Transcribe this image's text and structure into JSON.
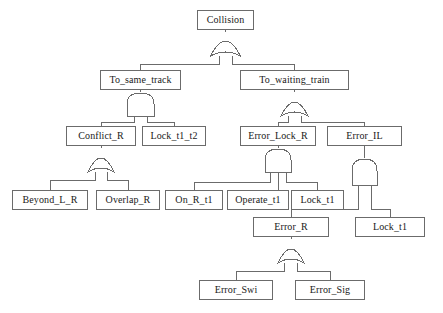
{
  "diagram": {
    "type": "fault-tree",
    "stroke_color": "#6b6b6b",
    "text_color": "#1a1a1a",
    "background": "#ffffff"
  },
  "nodes": [
    {
      "id": "collision",
      "label": "Collision",
      "x": 197,
      "y": 10,
      "w": 57,
      "h": 20,
      "level": 0,
      "kind": "top-event"
    },
    {
      "id": "to_same_track",
      "label": "To_same_track",
      "x": 100,
      "y": 70,
      "w": 81,
      "h": 20,
      "level": 1,
      "kind": "intermediate-event"
    },
    {
      "id": "to_waiting_train",
      "label": "To_waiting_train",
      "x": 240,
      "y": 70,
      "w": 109,
      "h": 20,
      "level": 1,
      "kind": "intermediate-event"
    },
    {
      "id": "conflict_r",
      "label": "Conflict_R",
      "x": 66,
      "y": 126,
      "w": 70,
      "h": 20,
      "level": 2,
      "kind": "intermediate-event"
    },
    {
      "id": "lock_t1_t2",
      "label": "Lock_t1_t2",
      "x": 142,
      "y": 126,
      "w": 64,
      "h": 20,
      "level": 2,
      "kind": "basic-event"
    },
    {
      "id": "error_lock_r",
      "label": "Error_Lock_R",
      "x": 240,
      "y": 126,
      "w": 76,
      "h": 20,
      "level": 2,
      "kind": "intermediate-event"
    },
    {
      "id": "error_il",
      "label": "Error_IL",
      "x": 327,
      "y": 126,
      "w": 75,
      "h": 20,
      "level": 2,
      "kind": "intermediate-event"
    },
    {
      "id": "beyond_l_r",
      "label": "Beyond_L_R",
      "x": 12,
      "y": 190,
      "w": 76,
      "h": 20,
      "level": 3,
      "kind": "basic-event"
    },
    {
      "id": "overlap_r",
      "label": "Overlap_R",
      "x": 96,
      "y": 190,
      "w": 64,
      "h": 20,
      "level": 3,
      "kind": "basic-event"
    },
    {
      "id": "on_r_t1",
      "label": "On_R_t1",
      "x": 165,
      "y": 190,
      "w": 58,
      "h": 20,
      "level": 3,
      "kind": "basic-event"
    },
    {
      "id": "operate_t1",
      "label": "Operate_t1",
      "x": 227,
      "y": 190,
      "w": 62,
      "h": 20,
      "level": 3,
      "kind": "basic-event"
    },
    {
      "id": "lock_t1_a",
      "label": "Lock_t1",
      "x": 291,
      "y": 190,
      "w": 53,
      "h": 20,
      "level": 3,
      "kind": "basic-event"
    },
    {
      "id": "error_r",
      "label": "Error_R",
      "x": 253,
      "y": 217,
      "w": 76,
      "h": 20,
      "level": 4,
      "kind": "intermediate-event"
    },
    {
      "id": "lock_t1_b",
      "label": "Lock_t1",
      "x": 355,
      "y": 217,
      "w": 70,
      "h": 20,
      "level": 4,
      "kind": "basic-event"
    },
    {
      "id": "error_swi",
      "label": "Error_Swi",
      "x": 199,
      "y": 280,
      "w": 74,
      "h": 20,
      "level": 5,
      "kind": "basic-event"
    },
    {
      "id": "error_sig",
      "label": "Error_Sig",
      "x": 295,
      "y": 280,
      "w": 70,
      "h": 20,
      "level": 5,
      "kind": "basic-event"
    }
  ],
  "gates": [
    {
      "id": "g-collision",
      "type": "OR",
      "label": "OR",
      "cx": 225.5,
      "top": 32,
      "parent": "collision",
      "children": [
        "to_same_track",
        "to_waiting_train"
      ]
    },
    {
      "id": "g-same-track",
      "type": "AND",
      "label": "AND",
      "cx": 140.5,
      "top": 92,
      "parent": "to_same_track",
      "children": [
        "conflict_r",
        "lock_t1_t2"
      ]
    },
    {
      "id": "g-waiting",
      "type": "OR",
      "label": "OR",
      "cx": 294.5,
      "top": 92,
      "parent": "to_waiting_train",
      "children": [
        "error_lock_r",
        "error_il"
      ]
    },
    {
      "id": "g-conflict",
      "type": "OR",
      "label": "OR",
      "cx": 101,
      "top": 148,
      "parent": "conflict_r",
      "children": [
        "beyond_l_r",
        "overlap_r"
      ]
    },
    {
      "id": "g-error-lock-r",
      "type": "AND",
      "label": "AND",
      "cx": 278,
      "top": 148,
      "parent": "error_lock_r",
      "children": [
        "on_r_t1",
        "operate_t1",
        "lock_t1_a"
      ]
    },
    {
      "id": "g-error-il",
      "type": "AND",
      "label": "AND",
      "cx": 364.5,
      "top": 158,
      "parent": "error_il",
      "children": [
        "error_r",
        "lock_t1_b"
      ]
    },
    {
      "id": "g-error-r",
      "type": "OR",
      "label": "OR",
      "cx": 291,
      "top": 239,
      "parent": "error_r",
      "children": [
        "error_swi",
        "error_sig"
      ]
    }
  ]
}
